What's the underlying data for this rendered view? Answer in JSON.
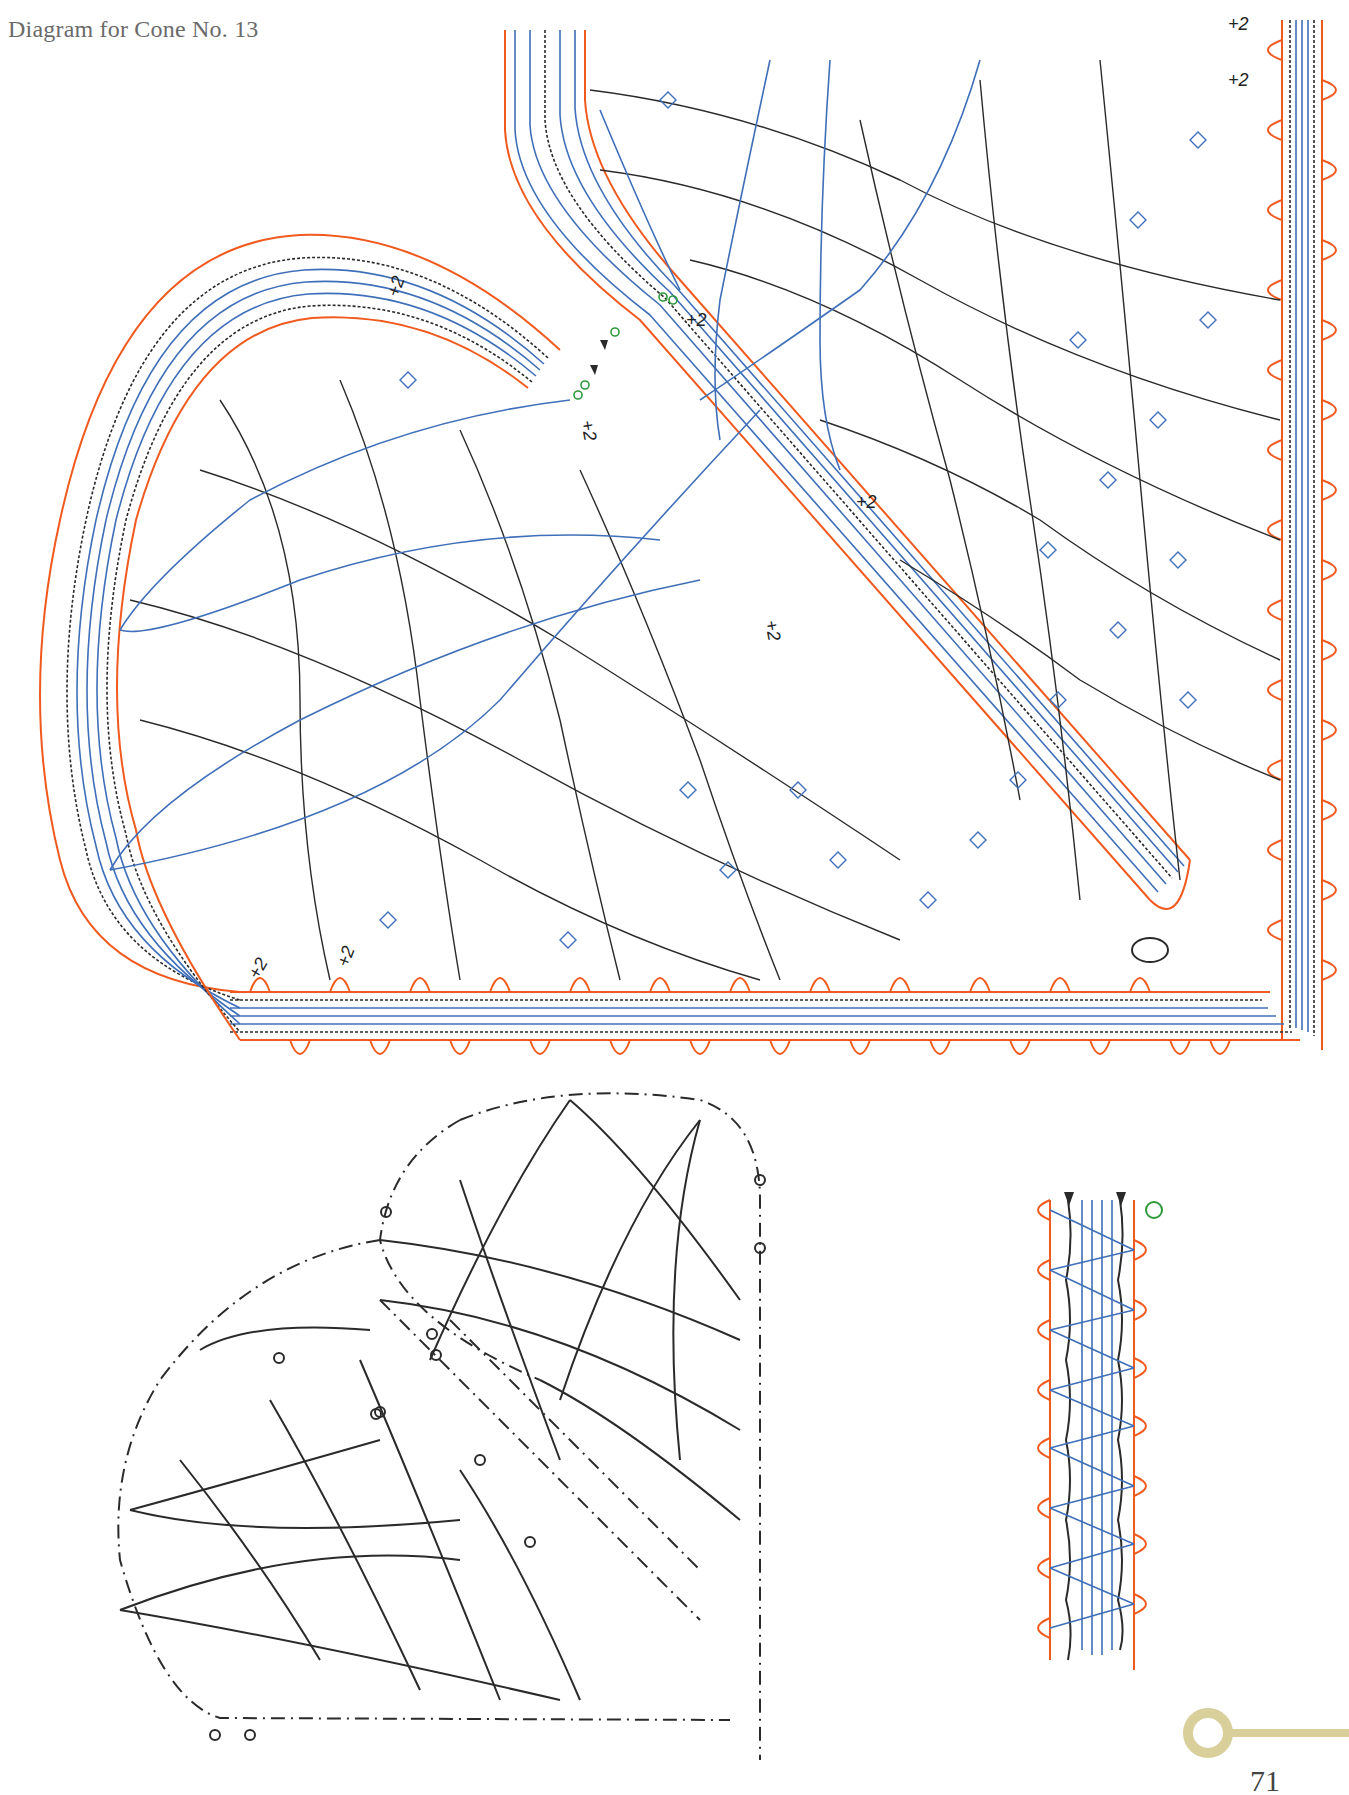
{
  "page": {
    "title": "Diagram for Cone No. 13",
    "page_number": "71"
  },
  "colors": {
    "pinhole_outline": "#f05a1e",
    "passives_blue": "#3f6fb8",
    "workers_black": "#2a2a2a",
    "start_marker_green": "#2e9a3c",
    "page_ornament": "#d9cf9a",
    "title_grey": "#6a6a6a"
  },
  "figures": {
    "main_pricking": {
      "label": "Coloured working diagram (cone corner)",
      "annotations": [
        "+2",
        "+2",
        "+2",
        "+2",
        "+2",
        "+2",
        "+2",
        "+2",
        "+2"
      ],
      "legend_symbols": [
        "pinhole-loop",
        "passive-pair-blue",
        "worker-pair-wavy-black",
        "tally-cross-blue",
        "start-marker-green-circle",
        "start-marker-black-triangle"
      ]
    },
    "thread_diagram": {
      "label": "Line drawing of pair paths with arrows",
      "symbols": [
        "dash-dot-outline",
        "pin-circle",
        "direction-arrow",
        "tally-hatch"
      ]
    },
    "footside_detail": {
      "label": "Braid / footside detail strip",
      "pin_loops_left": 8,
      "pin_loops_right": 8
    }
  }
}
